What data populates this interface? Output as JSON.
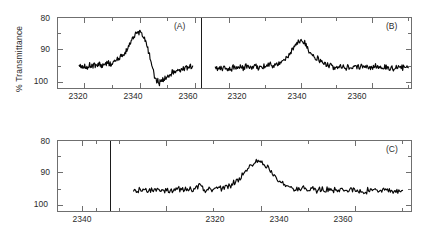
{
  "figure": {
    "title": "",
    "background": "#ffffff",
    "trace_color": "#070707",
    "axis_color": "#6f6f6f"
  },
  "axes": {
    "ylabel": "% Transmittance",
    "y_ticks_major": [
      "80",
      "90",
      "100"
    ],
    "y_values_major": [
      80,
      90,
      100
    ],
    "ylim": [
      80,
      102
    ],
    "y_inverted": true,
    "x_ticks_major": [
      "2320",
      "2340",
      "2360"
    ],
    "x_values_major": [
      2320,
      2340,
      2360
    ],
    "xlim": [
      2310,
      2370
    ],
    "minor_ticks_per_interval": 1,
    "grid": false
  },
  "panels": [
    {
      "tag": "(A)",
      "xlabels": [
        "2320",
        "2340",
        "2360"
      ],
      "ylabel": "% Transmittance",
      "ylabels": [
        "80",
        "90",
        "100"
      ],
      "feature": "derivative-shaped CO2 band: positive lobe peaking near 2340 then negative lobe near 2345",
      "peak_position": 2340,
      "peak_transmittance": 84.5,
      "trough_transmittance": 100.0,
      "baseline_transmittance": 95.0,
      "data_start": 2318,
      "data_end": 2359
    },
    {
      "tag": "(B)",
      "xlabels": [
        "2320",
        "2340",
        "2360"
      ],
      "ylabel": "% Transmittance",
      "ylabels": [
        "80",
        "90",
        "100"
      ],
      "feature": "single upward emission-like peak at 2340 on a flat baseline",
      "peak_position": 2340,
      "peak_transmittance": 87.0,
      "baseline_transmittance": 95.5,
      "data_start": 2316,
      "data_end": 2370
    },
    {
      "tag": "(C)",
      "xlabels": [
        "2340",
        "2320",
        "2340",
        "2360"
      ],
      "ylabel": "% Transmittance",
      "ylabels": [
        "80",
        "90",
        "100"
      ],
      "feature": "single sharp upward peak at 2340 on a flat baseline; left sub-axis blank",
      "peak_position": 2340,
      "peak_transmittance": 86.5,
      "baseline_transmittance": 95.5,
      "data_start": 2313,
      "data_end": 2370
    }
  ],
  "chart_data": [
    {
      "type": "line",
      "title": "(A)",
      "xlabel": "",
      "ylabel": "% Transmittance",
      "xlim": [
        2310,
        2362
      ],
      "ylim": [
        80,
        102
      ],
      "y_inverted": true,
      "xticks": [
        2320,
        2340,
        2360
      ],
      "yticks": [
        80,
        90,
        100
      ],
      "legend": "none",
      "grid": false,
      "series": [
        {
          "name": "Spectrum A",
          "x": [
            2318,
            2319,
            2320,
            2321,
            2322,
            2323,
            2324,
            2325,
            2326,
            2327,
            2328,
            2329,
            2330,
            2331,
            2332,
            2333,
            2334,
            2335,
            2336,
            2337,
            2338,
            2339,
            2340,
            2341,
            2342,
            2343,
            2344,
            2345,
            2346,
            2347,
            2348,
            2349,
            2350,
            2351,
            2352,
            2353,
            2354,
            2355,
            2356,
            2357,
            2358,
            2359
          ],
          "values": [
            95.4,
            95.0,
            94.8,
            95.2,
            94.6,
            95.0,
            94.7,
            94.4,
            94.8,
            94.3,
            94.0,
            94.3,
            93.8,
            93.3,
            92.9,
            92.3,
            91.4,
            90.3,
            88.6,
            86.8,
            85.4,
            84.8,
            84.6,
            85.6,
            87.4,
            90.2,
            94.0,
            97.6,
            99.6,
            99.9,
            99.3,
            98.6,
            98.0,
            97.5,
            97.0,
            96.6,
            96.2,
            95.9,
            95.6,
            95.3,
            95.1,
            95.0
          ]
        }
      ]
    },
    {
      "type": "line",
      "title": "(B)",
      "xlabel": "",
      "ylabel": "% Transmittance",
      "xlim": [
        2312,
        2371
      ],
      "ylim": [
        80,
        102
      ],
      "y_inverted": true,
      "xticks": [
        2320,
        2340,
        2360
      ],
      "yticks": [
        80,
        90,
        100
      ],
      "legend": "none",
      "grid": false,
      "series": [
        {
          "name": "Spectrum B",
          "x": [
            2316,
            2317,
            2318,
            2319,
            2320,
            2321,
            2322,
            2323,
            2324,
            2325,
            2326,
            2327,
            2328,
            2329,
            2330,
            2331,
            2332,
            2333,
            2334,
            2335,
            2336,
            2337,
            2338,
            2339,
            2340,
            2341,
            2342,
            2343,
            2344,
            2345,
            2346,
            2347,
            2348,
            2349,
            2350,
            2351,
            2352,
            2353,
            2354,
            2355,
            2356,
            2357,
            2358,
            2359,
            2360,
            2361,
            2362,
            2363,
            2364,
            2365,
            2366,
            2367,
            2368,
            2369,
            2370
          ],
          "values": [
            96.0,
            95.6,
            95.9,
            95.4,
            95.8,
            95.3,
            95.6,
            95.2,
            95.5,
            95.1,
            95.4,
            95.0,
            95.3,
            94.9,
            95.1,
            94.7,
            94.9,
            94.5,
            94.3,
            93.6,
            92.6,
            91.0,
            89.2,
            87.8,
            87.0,
            88.2,
            89.8,
            91.2,
            92.4,
            93.3,
            94.0,
            94.5,
            94.9,
            95.1,
            95.3,
            95.0,
            95.4,
            95.1,
            95.4,
            95.2,
            95.5,
            95.2,
            95.5,
            95.3,
            95.5,
            95.3,
            95.6,
            95.3,
            95.5,
            95.4,
            95.6,
            95.3,
            95.5,
            95.4,
            95.5
          ]
        }
      ]
    },
    {
      "type": "line",
      "title": "(C)",
      "xlabel": "",
      "ylabel": "% Transmittance",
      "xlim": [
        2308,
        2372
      ],
      "ylim": [
        80,
        102
      ],
      "y_inverted": true,
      "xticks": [
        2320,
        2340,
        2360
      ],
      "yticks": [
        80,
        90,
        100
      ],
      "legend": "none",
      "grid": false,
      "series": [
        {
          "name": "Spectrum C",
          "x": [
            2313,
            2314,
            2315,
            2316,
            2317,
            2318,
            2319,
            2320,
            2321,
            2322,
            2323,
            2324,
            2325,
            2326,
            2327,
            2328,
            2329,
            2330,
            2331,
            2332,
            2333,
            2334,
            2335,
            2336,
            2337,
            2338,
            2339,
            2340,
            2341,
            2342,
            2343,
            2344,
            2345,
            2346,
            2347,
            2348,
            2349,
            2350,
            2351,
            2352,
            2353,
            2354,
            2355,
            2356,
            2357,
            2358,
            2359,
            2360,
            2361,
            2362,
            2363,
            2364,
            2365,
            2366,
            2367,
            2368,
            2369,
            2370
          ],
          "values": [
            95.6,
            95.2,
            95.6,
            95.1,
            95.5,
            95.2,
            95.6,
            95.1,
            95.5,
            95.2,
            95.4,
            95.0,
            95.4,
            95.1,
            93.2,
            95.3,
            95.0,
            95.2,
            94.8,
            94.6,
            94.1,
            93.4,
            92.4,
            90.8,
            89.0,
            87.6,
            86.8,
            86.5,
            87.8,
            89.6,
            91.2,
            92.6,
            93.6,
            94.3,
            94.8,
            95.1,
            94.8,
            95.2,
            94.9,
            95.3,
            95.0,
            95.4,
            95.1,
            95.4,
            95.2,
            95.5,
            95.2,
            95.5,
            95.3,
            95.5,
            95.2,
            95.5,
            95.3,
            95.5,
            95.2,
            95.5,
            95.3,
            95.4
          ]
        }
      ]
    }
  ]
}
